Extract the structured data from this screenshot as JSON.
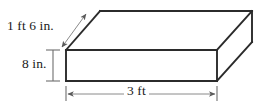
{
  "figure": {
    "name": "rectangular-prism-with-dimensions",
    "shape": "rectangular prism",
    "background_color": "#ffffff",
    "edge_color": "#2b2b2b",
    "dimension_line_color": "#6e6e6e",
    "text_color": "#1a1a1a"
  },
  "labels": {
    "depth": "1 ft 6 in.",
    "height": "8 in.",
    "width": "3 ft"
  },
  "measurements": [
    {
      "name": "depth",
      "value": "1 ft 6 in.",
      "magnitude": 18,
      "unit": "in",
      "edge": "back-diagonal"
    },
    {
      "name": "height",
      "value": "8 in.",
      "magnitude": 8,
      "unit": "in",
      "edge": "vertical-left"
    },
    {
      "name": "width",
      "value": "3 ft",
      "magnitude": 3,
      "unit": "ft",
      "edge": "bottom-front"
    }
  ],
  "geometry": {
    "front_face": {
      "x": 66,
      "y": 50,
      "width": 151,
      "height": 31
    },
    "depth_offset": {
      "dx": 35,
      "dy": -39
    },
    "vertices": {
      "front_top_left": [
        66,
        50
      ],
      "front_top_right": [
        217,
        50
      ],
      "front_bottom_left": [
        66,
        81
      ],
      "front_bottom_right": [
        217,
        81
      ],
      "back_top_left": [
        100,
        11
      ],
      "back_top_right": [
        252,
        11
      ],
      "back_bottom_right": [
        252,
        42
      ]
    }
  }
}
